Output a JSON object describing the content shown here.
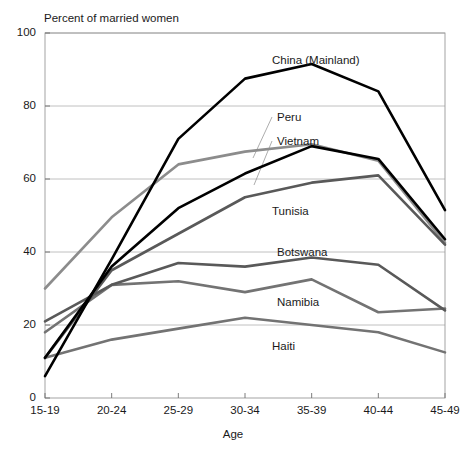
{
  "chart_data": {
    "type": "line",
    "title": "",
    "ylabel": "Percent of married women",
    "xlabel": "Age",
    "categories": [
      "15-19",
      "20-24",
      "25-29",
      "30-34",
      "35-39",
      "40-44",
      "45-49"
    ],
    "ylim": [
      0,
      100
    ],
    "yticks": [
      0,
      20,
      40,
      60,
      80,
      100
    ],
    "grid": "horizontal",
    "legend": "inline-labels",
    "series": [
      {
        "name": "China (Mainland)",
        "color": "#000000",
        "width": 2.6,
        "values": [
          6,
          38,
          71,
          87.5,
          91.5,
          84,
          51.5
        ]
      },
      {
        "name": "Peru",
        "color": "#8c8c8c",
        "width": 2.6,
        "values": [
          30,
          49.5,
          64,
          67.5,
          69.5,
          65,
          42.5
        ]
      },
      {
        "name": "Vietnam",
        "color": "#000000",
        "width": 2.6,
        "values": [
          11,
          36,
          52,
          61.5,
          69,
          65.5,
          43.5
        ]
      },
      {
        "name": "Tunisia",
        "color": "#595959",
        "width": 2.6,
        "values": [
          11,
          35,
          45,
          55,
          59,
          61,
          42
        ]
      },
      {
        "name": "Botswana",
        "color": "#595959",
        "width": 2.6,
        "values": [
          21,
          31,
          37,
          36,
          38.5,
          36.5,
          24
        ]
      },
      {
        "name": "Namibia",
        "color": "#737373",
        "width": 2.6,
        "values": [
          18,
          31,
          32,
          29,
          32.5,
          23.5,
          24.5
        ]
      },
      {
        "name": "Haiti",
        "color": "#737373",
        "width": 2.6,
        "values": [
          11,
          16,
          19,
          22,
          20,
          18,
          12.5
        ]
      }
    ],
    "annotations": [
      {
        "text": "China (Mainland)",
        "x": 272,
        "y": 54
      },
      {
        "text": "Peru",
        "x": 277,
        "y": 111
      },
      {
        "text": "Vietnam",
        "x": 277,
        "y": 135
      },
      {
        "text": "Tunisia",
        "x": 272,
        "y": 205
      },
      {
        "text": "Botswana",
        "x": 277,
        "y": 246
      },
      {
        "text": "Namibia",
        "x": 277,
        "y": 296
      },
      {
        "text": "Haiti",
        "x": 272,
        "y": 340
      }
    ],
    "leader_lines": [
      {
        "for": "Peru",
        "x1": 272,
        "y1": 117,
        "x2": 253,
        "y2": 158
      },
      {
        "for": "Vietnam",
        "x1": 272,
        "y1": 141,
        "x2": 254,
        "y2": 185
      }
    ]
  }
}
